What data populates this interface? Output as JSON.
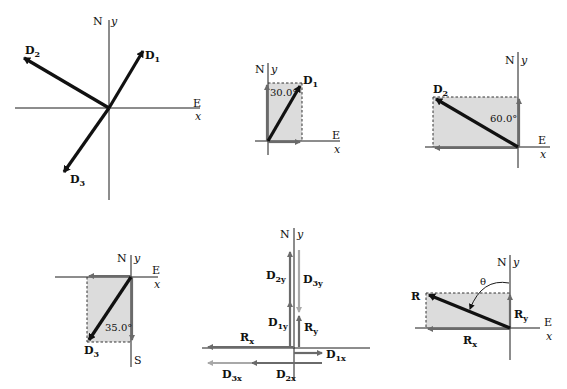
{
  "panels": [
    {
      "id": "vectors-all",
      "axis_labels": {
        "north": "N",
        "y": "y",
        "east": "E",
        "x": "x"
      },
      "vectors": [
        {
          "name": "D",
          "sub": "1"
        },
        {
          "name": "D",
          "sub": "2"
        },
        {
          "name": "D",
          "sub": "3"
        }
      ]
    },
    {
      "id": "d1-components",
      "axis_labels": {
        "north": "N",
        "y": "y",
        "east": "E",
        "x": "x"
      },
      "vector": {
        "name": "D",
        "sub": "1"
      },
      "angle_label": "30.0°"
    },
    {
      "id": "d2-components",
      "axis_labels": {
        "north": "N",
        "y": "y",
        "east": "E",
        "x": "x"
      },
      "vector": {
        "name": "D",
        "sub": "2"
      },
      "angle_label": "60.0°"
    },
    {
      "id": "d3-components",
      "axis_labels": {
        "north": "N",
        "y": "y",
        "east": "E",
        "x": "x",
        "south": "S"
      },
      "vector": {
        "name": "D",
        "sub": "3"
      },
      "angle_label": "35.0°"
    },
    {
      "id": "component-sum",
      "axis_labels": {
        "north": "N",
        "y": "y"
      },
      "components": [
        {
          "name": "D",
          "sub": "2y"
        },
        {
          "name": "D",
          "sub": "3y"
        },
        {
          "name": "D",
          "sub": "1y"
        },
        {
          "name": "R",
          "sub": "y"
        },
        {
          "name": "R",
          "sub": "x"
        },
        {
          "name": "D",
          "sub": "1x"
        },
        {
          "name": "D",
          "sub": "3x"
        },
        {
          "name": "D",
          "sub": "2x"
        }
      ]
    },
    {
      "id": "resultant",
      "axis_labels": {
        "north": "N",
        "y": "y",
        "east": "E",
        "x": "x"
      },
      "vector": {
        "name": "R"
      },
      "components": [
        {
          "name": "R",
          "sub": "y"
        },
        {
          "name": "R",
          "sub": "x"
        }
      ],
      "angle_label": "θ"
    }
  ]
}
